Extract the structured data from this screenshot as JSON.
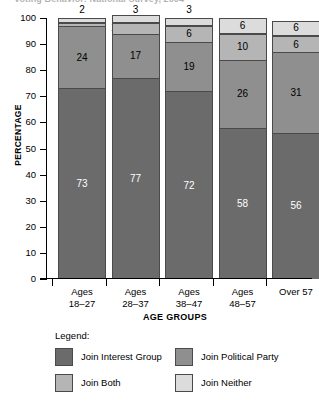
{
  "title": "Voting Behavior: National Survey, 2004",
  "axes": {
    "y_title": "PERCENTAGE",
    "x_title": "AGE GROUPS",
    "y_ticks": [
      "100",
      "90",
      "80",
      "70",
      "60",
      "50",
      "40",
      "30",
      "20",
      "10",
      "0"
    ]
  },
  "legend": {
    "heading": "Legend:",
    "items": [
      {
        "label": "Join Interest Group",
        "color": "#6b6b6b"
      },
      {
        "label": "Join Political Party",
        "color": "#8f8f8f"
      },
      {
        "label": "Join Both",
        "color": "#b5b5b5"
      },
      {
        "label": "Join Neither",
        "color": "#dcdcdc"
      }
    ]
  },
  "chart_data": {
    "type": "bar",
    "stacked": true,
    "title": "Voting Behavior: National Survey, 2004",
    "xlabel": "AGE GROUPS",
    "ylabel": "PERCENTAGE",
    "ylim": [
      0,
      100
    ],
    "ytick_step": 10,
    "grid": false,
    "legend_position": "bottom",
    "categories": [
      "Ages 18–27",
      "Ages 28–37",
      "Ages 38–47",
      "Ages 48–57",
      "Over 57"
    ],
    "category_lines": [
      [
        "Ages",
        "18–27"
      ],
      [
        "Ages",
        "28–37"
      ],
      [
        "Ages",
        "38–47"
      ],
      [
        "Ages",
        "48–57"
      ],
      [
        "Over 57",
        ""
      ]
    ],
    "series": [
      {
        "name": "Join Interest Group",
        "color": "#6b6b6b",
        "values": [
          73,
          77,
          72,
          58,
          56
        ]
      },
      {
        "name": "Join Political Party",
        "color": "#8f8f8f",
        "values": [
          24,
          17,
          19,
          26,
          31
        ]
      },
      {
        "name": "Join Both",
        "color": "#b5b5b5",
        "values": [
          1,
          4,
          6,
          10,
          6
        ]
      },
      {
        "name": "Join Neither",
        "color": "#dcdcdc",
        "values": [
          2,
          3,
          3,
          6,
          6
        ]
      }
    ],
    "outside_labels": {
      "above_bar": [
        "2",
        "3",
        "3",
        null,
        null
      ],
      "callout": [
        "1",
        null,
        null,
        null,
        null
      ]
    }
  }
}
